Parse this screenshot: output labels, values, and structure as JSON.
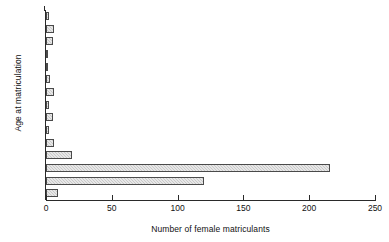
{
  "chart_data": {
    "type": "bar",
    "orientation": "horizontal",
    "title": "",
    "xlabel": "Number of female matriculants",
    "ylabel": "Age at matriculation",
    "xlim": [
      0,
      250
    ],
    "xticks": [
      0,
      50,
      100,
      150,
      200,
      250
    ],
    "grid": false,
    "legend": false,
    "categories": [
      "30",
      "29",
      "28",
      "27",
      "26",
      "25",
      "24",
      "23",
      "22",
      "21",
      "20",
      "19",
      "18",
      "17",
      "16"
    ],
    "values": [
      2,
      6,
      5,
      1,
      1,
      3,
      6,
      2,
      5,
      2,
      6,
      20,
      216,
      120,
      9
    ],
    "bar_fill_color": "#c9c9c9",
    "bar_edge_color": "#4a4a4a",
    "axis_color": "#2a2a2a",
    "background_color": "#ffffff"
  }
}
